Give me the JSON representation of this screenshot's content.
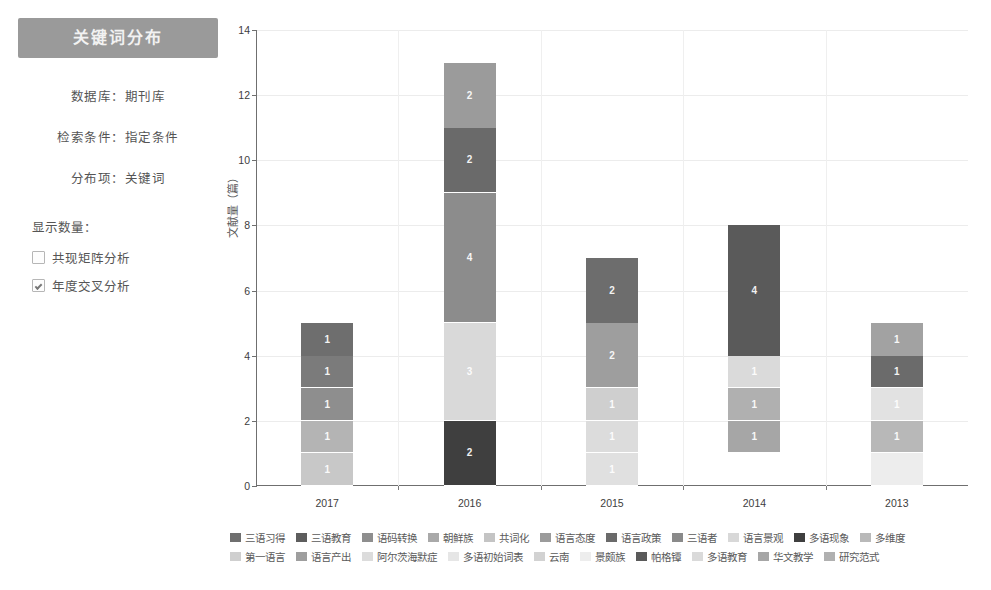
{
  "panel": {
    "title": "关键词分布",
    "meta": [
      "数据库：期刊库",
      "检索条件：指定条件",
      "分布项：关键词"
    ],
    "count_label": "显示数量：",
    "options": [
      {
        "label": "共现矩阵分析",
        "checked": false
      },
      {
        "label": "年度交叉分析",
        "checked": true
      }
    ]
  },
  "chart_data": {
    "type": "bar",
    "stacked": true,
    "title": "",
    "xlabel": "",
    "ylabel": "文献量（篇）",
    "ylim": [
      0,
      14
    ],
    "yticks": [
      0,
      2,
      4,
      6,
      8,
      10,
      12,
      14
    ],
    "grid": true,
    "legend_position": "bottom",
    "categories": [
      "2017",
      "2016",
      "2015",
      "2014",
      "2013"
    ],
    "totals": [
      5,
      13,
      7,
      8,
      5
    ],
    "series": [
      {
        "name": "三语习得",
        "color": "#6f6f6f",
        "values": [
          1,
          0,
          0,
          0,
          0
        ]
      },
      {
        "name": "三语教育",
        "color": "#5d5d5d",
        "values": [
          1,
          0,
          0,
          0,
          0
        ]
      },
      {
        "name": "语码转换",
        "color": "#8e8e8e",
        "values": [
          1,
          0,
          0,
          0,
          0
        ]
      },
      {
        "name": "朝鲜族",
        "color": "#a9a9a9",
        "values": [
          1,
          0,
          0,
          0,
          0
        ]
      },
      {
        "name": "共词化",
        "color": "#c4c4c4",
        "values": [
          1,
          0,
          0,
          0,
          0
        ]
      },
      {
        "name": "语言态度",
        "color": "#9b9b9b",
        "values": [
          0,
          2,
          0,
          0,
          0
        ]
      },
      {
        "name": "语言政策",
        "color": "#6a6a6a",
        "values": [
          0,
          2,
          0,
          0,
          0
        ]
      },
      {
        "name": "三语者",
        "color": "#8a8a8a",
        "values": [
          0,
          4,
          0,
          0,
          0
        ]
      },
      {
        "name": "语言景观",
        "color": "#d8d8d8",
        "values": [
          0,
          3,
          0,
          0,
          0
        ]
      },
      {
        "name": "多语现象",
        "color": "#3f3f3f",
        "values": [
          0,
          2,
          0,
          0,
          0
        ]
      },
      {
        "name": "多维度",
        "color": "#b9b9b9",
        "values": [
          0,
          0,
          0,
          0,
          0
        ]
      },
      {
        "name": "第一语言",
        "color": "#cfcfcf",
        "values": [
          0,
          0,
          2,
          0,
          0
        ]
      },
      {
        "name": "语言产出",
        "color": "#9e9e9e",
        "values": [
          0,
          0,
          2,
          0,
          0
        ]
      },
      {
        "name": "阿尔茨海默症",
        "color": "#dcdcdc",
        "values": [
          0,
          0,
          1,
          0,
          0
        ]
      },
      {
        "name": "多语初始词表",
        "color": "#e6e6e6",
        "values": [
          0,
          0,
          1,
          0,
          0
        ]
      },
      {
        "name": "云南",
        "color": "#d2d2d2",
        "values": [
          0,
          0,
          1,
          0,
          0
        ]
      },
      {
        "name": "景颇族",
        "color": "#ededed",
        "values": [
          0,
          0,
          0,
          0,
          0
        ]
      },
      {
        "name": "帕格镡",
        "color": "#5a5a5a",
        "values": [
          0,
          0,
          0,
          4,
          0
        ]
      },
      {
        "name": "多语教育",
        "color": "#dadada",
        "values": [
          0,
          0,
          0,
          1,
          0
        ]
      },
      {
        "name": "华文教学",
        "color": "#a6a6a6",
        "values": [
          0,
          0,
          0,
          1,
          0
        ]
      },
      {
        "name": "研究范式",
        "color": "#b0b0b0",
        "values": [
          0,
          0,
          0,
          1,
          0
        ]
      }
    ],
    "bars": [
      {
        "category": "2017",
        "base": 0,
        "segments": [
          {
            "value": 1,
            "color": "#c8c8c8",
            "label": "1"
          },
          {
            "value": 1,
            "color": "#b4b4b4",
            "label": "1"
          },
          {
            "value": 1,
            "color": "#8e8e8e",
            "label": "1"
          },
          {
            "value": 1,
            "color": "#7b7b7b",
            "label": "1"
          },
          {
            "value": 1,
            "color": "#6e6e6e",
            "label": "1"
          }
        ]
      },
      {
        "category": "2016",
        "base": 0,
        "segments": [
          {
            "value": 2,
            "color": "#3f3f3f",
            "label": "2"
          },
          {
            "value": 3,
            "color": "#d9d9d9",
            "label": "3"
          },
          {
            "value": 4,
            "color": "#8c8c8c",
            "label": "4"
          },
          {
            "value": 2,
            "color": "#6a6a6a",
            "label": "2"
          },
          {
            "value": 2,
            "color": "#9b9b9b",
            "label": "2"
          }
        ]
      },
      {
        "category": "2015",
        "base": 0,
        "segments": [
          {
            "value": 1,
            "color": "#e0e0e0",
            "label": "1"
          },
          {
            "value": 1,
            "color": "#dcdcdc",
            "label": "1"
          },
          {
            "value": 1,
            "color": "#cfcfcf",
            "label": "1"
          },
          {
            "value": 2,
            "color": "#9e9e9e",
            "label": "2"
          },
          {
            "value": 2,
            "color": "#6d6d6d",
            "label": "2"
          }
        ]
      },
      {
        "category": "2014",
        "base": 1,
        "segments": [
          {
            "value": 1,
            "color": "#a6a6a6",
            "label": "1"
          },
          {
            "value": 1,
            "color": "#b0b0b0",
            "label": "1"
          },
          {
            "value": 1,
            "color": "#dadada",
            "label": "1"
          },
          {
            "value": 4,
            "color": "#5a5a5a",
            "label": "4"
          }
        ]
      },
      {
        "category": "2013",
        "base": 0,
        "segments": [
          {
            "value": 1,
            "color": "#ededed",
            "label": ""
          },
          {
            "value": 1,
            "color": "#b8b8b8",
            "label": "1"
          },
          {
            "value": 1,
            "color": "#e2e2e2",
            "label": "1"
          },
          {
            "value": 1,
            "color": "#6b6b6b",
            "label": "1"
          },
          {
            "value": 1,
            "color": "#a2a2a2",
            "label": "1"
          }
        ]
      }
    ],
    "legend": [
      "三语习得",
      "三语教育",
      "语码转换",
      "朝鲜族",
      "共词化",
      "语言态度",
      "语言政策",
      "三语者",
      "语言景观",
      "多语现象",
      "多维度",
      "第一语言",
      "语言产出",
      "阿尔茨海默症",
      "多语初始词表",
      "云南",
      "景颇族",
      "帕格镡",
      "多语教育",
      "华文教学",
      "研究范式"
    ]
  }
}
